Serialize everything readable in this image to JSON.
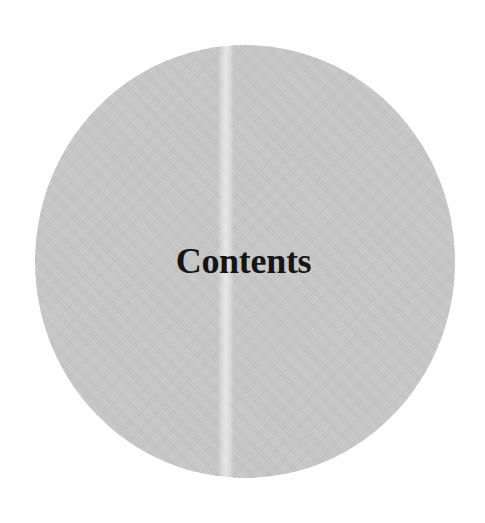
{
  "page": {
    "title": "Contents"
  },
  "colors": {
    "background": "#ffffff",
    "disc": "#c9c9c9",
    "text": "#151515"
  }
}
